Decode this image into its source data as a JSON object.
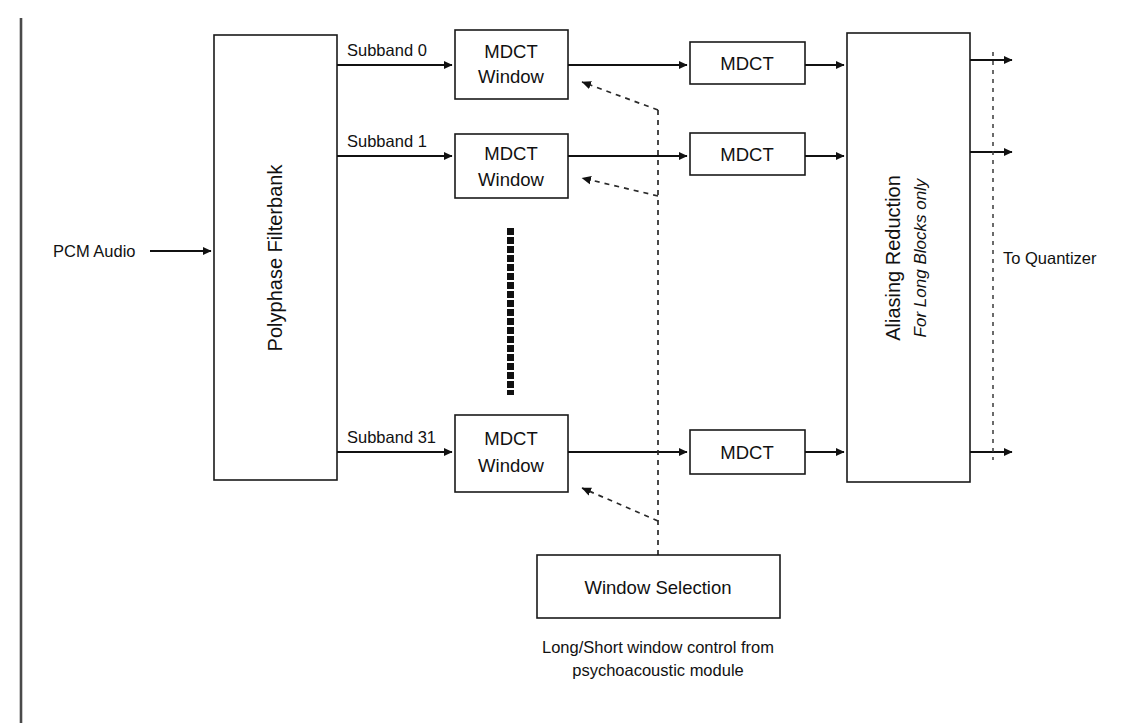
{
  "diagram": {
    "title_header": "",
    "input": {
      "label": "PCM Audio"
    },
    "filterbank": {
      "label": "Polyphase Filterbank"
    },
    "subbands": [
      {
        "label": "Subband 0"
      },
      {
        "label": "Subband 1"
      },
      {
        "label": "Subband 31"
      }
    ],
    "window_boxes": [
      {
        "line1": "MDCT",
        "line2": "Window"
      },
      {
        "line1": "MDCT",
        "line2": "Window"
      },
      {
        "line1": "MDCT",
        "line2": "Window"
      }
    ],
    "mdct_boxes": [
      {
        "label": "MDCT"
      },
      {
        "label": "MDCT"
      },
      {
        "label": "MDCT"
      }
    ],
    "aliasing": {
      "line1": "Aliasing Reduction",
      "line2": "For Long Blocks only"
    },
    "output": {
      "label": "To Quantizer"
    },
    "window_selection": {
      "label": "Window Selection"
    },
    "caption": {
      "line1": "Long/Short window control from",
      "line2": "psychoacoustic module"
    },
    "ellipsis_dot_count": 19,
    "colors": {
      "stroke": "#111111",
      "background": "#ffffff",
      "page_edge": "#4a4a4a"
    }
  }
}
